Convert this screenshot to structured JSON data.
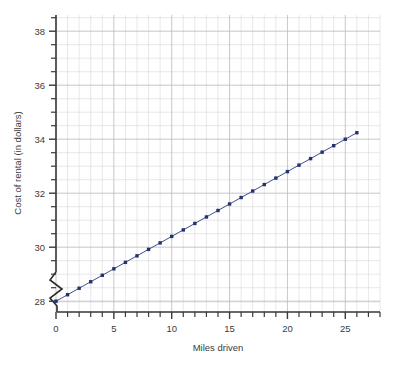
{
  "chart_data": {
    "type": "scatter",
    "title": "",
    "xlabel": "Miles driven",
    "ylabel": "Cost of rental (in dollars)",
    "xlim": [
      0,
      28
    ],
    "ylim": [
      27.6,
      38.6
    ],
    "xticks": [
      0,
      5,
      10,
      15,
      20,
      25
    ],
    "yticks": [
      28,
      30,
      32,
      34,
      36,
      38
    ],
    "xtick_labels": [
      "0",
      "5",
      "10",
      "15",
      "20",
      "25"
    ],
    "ytick_labels": [
      "28",
      "30",
      "32",
      "34",
      "36",
      "38"
    ],
    "x_minor_tick_step": 1,
    "y_minor_tick_step": 0.5,
    "grid": true,
    "legend": "none",
    "y_axis_break": true,
    "marker_color": "#23336f",
    "line_color": "#2b3b7e",
    "grid_color": "#d8d8dc",
    "axis_color": "#3a3a3a",
    "x": [
      0,
      1,
      2,
      3,
      4,
      5,
      6,
      7,
      8,
      9,
      10,
      11,
      12,
      13,
      14,
      15,
      16,
      17,
      18,
      19,
      20,
      21,
      22,
      23,
      24,
      25,
      26
    ],
    "y": [
      28.0,
      28.24,
      28.48,
      28.72,
      28.96,
      29.2,
      29.44,
      29.68,
      29.92,
      30.16,
      30.4,
      30.64,
      30.88,
      31.12,
      31.36,
      31.6,
      31.84,
      32.08,
      32.32,
      32.56,
      32.8,
      33.04,
      33.28,
      33.52,
      33.76,
      34.0,
      34.24
    ],
    "series": [
      {
        "name": "Cost of rental",
        "values": [
          28.0,
          28.24,
          28.48,
          28.72,
          28.96,
          29.2,
          29.44,
          29.68,
          29.92,
          30.16,
          30.4,
          30.64,
          30.88,
          31.12,
          31.36,
          31.6,
          31.84,
          32.08,
          32.32,
          32.56,
          32.8,
          33.04,
          33.28,
          33.52,
          33.76,
          34.0,
          34.24
        ]
      }
    ]
  },
  "axes": {
    "x_title": "Miles driven",
    "y_title": "Cost of rental (in dollars)"
  }
}
